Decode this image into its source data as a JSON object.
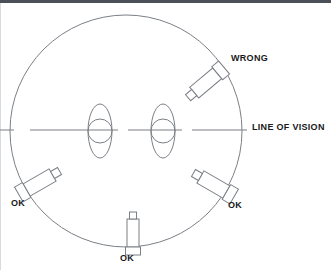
{
  "diagram": {
    "canvas": {
      "width": 331,
      "height": 270
    },
    "colors": {
      "stroke": "#7b7f86",
      "text": "#19191b",
      "background": "#ffffff",
      "top_border": "#4a4f58"
    },
    "head_circle": {
      "cx": 126,
      "cy": 131,
      "r": 116
    },
    "line_of_vision": {
      "y": 130,
      "segments": [
        {
          "x1": 0,
          "x2": 14
        },
        {
          "x1": 30,
          "x2": 118
        },
        {
          "x1": 128,
          "x2": 182
        },
        {
          "x1": 192,
          "x2": 247
        }
      ]
    },
    "eyes": [
      {
        "name": "left-eye",
        "cx": 100,
        "cy": 131,
        "rx": 12,
        "ry": 27,
        "iris_r": 12
      },
      {
        "name": "right-eye",
        "cx": 163,
        "cy": 131,
        "rx": 12,
        "ry": 27,
        "iris_r": 12
      }
    ],
    "instruments": [
      {
        "name": "instrument-wrong",
        "cx": 208,
        "cy": 81,
        "angle": -40,
        "status": "WRONG"
      },
      {
        "name": "instrument-ok-right",
        "cx": 216,
        "cy": 186,
        "angle": 30,
        "status": "OK"
      },
      {
        "name": "instrument-ok-left",
        "cx": 37,
        "cy": 184,
        "angle": -30,
        "status": "OK"
      },
      {
        "name": "instrument-ok-bottom",
        "cx": 133,
        "cy": 235,
        "angle": 90,
        "status": "OK"
      }
    ]
  },
  "labels": {
    "wrong": "WRONG",
    "line_of_vision": "LINE OF VISION",
    "ok_left": "OK",
    "ok_right": "OK",
    "ok_bottom": "OK"
  }
}
